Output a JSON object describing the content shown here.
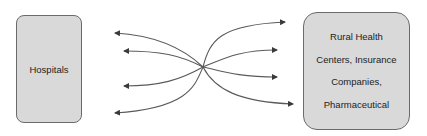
{
  "diagram": {
    "left_node": {
      "label": "Hospitals"
    },
    "right_node": {
      "lines": [
        "Rural Health",
        "Centers, Insurance",
        "Companies,",
        "Pharmaceutical"
      ]
    },
    "connector_color": "#5a5a5a",
    "box_fill": "#d9d9d9",
    "box_border": "#6b6b6b",
    "arrows": {
      "to_left": [
        {
          "end_x": 115,
          "end_y": 33
        },
        {
          "end_x": 124,
          "end_y": 51
        },
        {
          "end_x": 124,
          "end_y": 86
        },
        {
          "end_x": 115,
          "end_y": 113
        }
      ],
      "to_right": [
        {
          "end_x": 285,
          "end_y": 22
        },
        {
          "end_x": 277,
          "end_y": 50
        },
        {
          "end_x": 277,
          "end_y": 77
        },
        {
          "end_x": 293,
          "end_y": 104
        }
      ],
      "crossing_point": {
        "x": 203,
        "y": 67
      }
    }
  }
}
